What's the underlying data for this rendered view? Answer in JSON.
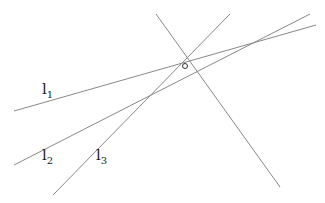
{
  "diagram": {
    "line_color": "#888888",
    "lines": [
      {
        "id": "l1",
        "x1": 14,
        "y1": 111,
        "x2": 316,
        "y2": 25
      },
      {
        "id": "l2",
        "x1": 14,
        "y1": 165,
        "x2": 310,
        "y2": 14
      },
      {
        "id": "l3",
        "x1": 53,
        "y1": 195,
        "x2": 230,
        "y2": 14
      },
      {
        "id": "l4",
        "x1": 156,
        "y1": 14,
        "x2": 280,
        "y2": 187
      }
    ],
    "point": {
      "cx": 185,
      "cy": 66,
      "r": 2.5
    },
    "labels": [
      {
        "base": "l",
        "sub": "1",
        "x": 42,
        "y": 80
      },
      {
        "base": "l",
        "sub": "2",
        "x": 42,
        "y": 146
      },
      {
        "base": "l",
        "sub": "3",
        "x": 96,
        "y": 146
      }
    ]
  }
}
